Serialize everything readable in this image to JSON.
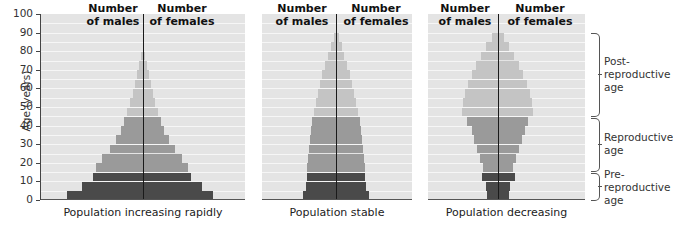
{
  "chart_data": {
    "type": "bar",
    "subtype": "population-pyramid",
    "ylabel": "Age (years)",
    "ylim": [
      0,
      100
    ],
    "yticks": [
      0,
      10,
      20,
      30,
      40,
      50,
      60,
      70,
      80,
      90,
      100
    ],
    "age_groups": [
      "0-4",
      "5-9",
      "10-14",
      "15-19",
      "20-24",
      "25-29",
      "30-34",
      "35-39",
      "40-44",
      "45-49",
      "50-54",
      "55-59",
      "60-64",
      "65-69",
      "70-74",
      "75-79",
      "80-84",
      "85-89"
    ],
    "header_left": "Number\nof males",
    "header_right": "Number\nof females",
    "band_colors": {
      "pre": "#4a4a4a",
      "repro": "#9a9a9a",
      "post": "#c4c4c4",
      "background": "#e4e4e4"
    },
    "bands": [
      {
        "name": "Pre-reproductive age",
        "label": "Pre-\nreproductive\nage",
        "from": 0,
        "to": 15
      },
      {
        "name": "Reproductive age",
        "label": "Reproductive\nage",
        "from": 15,
        "to": 45
      },
      {
        "name": "Post-reproductive age",
        "label": "Post-\nreproductive\nage",
        "from": 45,
        "to": 90
      }
    ],
    "series": [
      {
        "name": "Population increasing rapidly",
        "caption": "Population increasing rapidly",
        "males": [
          76,
          61,
          50,
          47,
          41,
          33,
          27,
          22,
          19,
          16,
          13,
          10,
          8,
          6,
          4,
          2,
          0,
          0
        ],
        "females": [
          70,
          59,
          48,
          45,
          39,
          32,
          26,
          21,
          18,
          15,
          12,
          10,
          8,
          6,
          4,
          2,
          0,
          0
        ]
      },
      {
        "name": "Population stable",
        "caption": "Population stable",
        "males": [
          33,
          30,
          29,
          29,
          28,
          27,
          26,
          25,
          24,
          22,
          20,
          18,
          16,
          14,
          11,
          8,
          5,
          2
        ],
        "females": [
          33,
          30,
          29,
          29,
          28,
          27,
          26,
          25,
          24,
          22,
          20,
          18,
          16,
          14,
          11,
          8,
          6,
          3
        ]
      },
      {
        "name": "Population decreasing",
        "caption": "Population decreasing",
        "males": [
          11,
          12,
          16,
          15,
          18,
          21,
          24,
          26,
          31,
          36,
          35,
          33,
          30,
          26,
          22,
          17,
          12,
          6
        ],
        "females": [
          11,
          12,
          17,
          15,
          18,
          21,
          24,
          27,
          30,
          35,
          34,
          32,
          29,
          25,
          21,
          16,
          11,
          6
        ]
      }
    ]
  },
  "axis": {
    "label": "Age (years)",
    "ticks": [
      "100",
      "90",
      "80",
      "70",
      "60",
      "50",
      "40",
      "30",
      "20",
      "10",
      "0"
    ]
  },
  "panels": [
    {
      "caption": "Population increasing rapidly",
      "left_header": "Number\nof males",
      "right_header": "Number\nof females"
    },
    {
      "caption": "Population stable",
      "left_header": "Number\nof males",
      "right_header": "Number\nof females"
    },
    {
      "caption": "Population decreasing",
      "left_header": "Number\nof males",
      "right_header": "Number\nof females"
    }
  ],
  "stages": {
    "post": "Post-\nreproductive\nage",
    "repro": "Reproductive\nage",
    "pre": "Pre-\nreproductive\nage"
  }
}
